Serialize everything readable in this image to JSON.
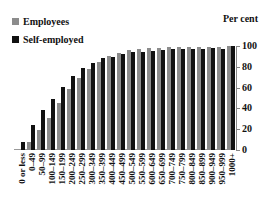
{
  "legend": {
    "items": [
      {
        "label": "Employees",
        "color": "#8c8c8c"
      },
      {
        "label": "Self-employed",
        "color": "#111111"
      }
    ]
  },
  "unit_label": "Per cent",
  "chart_data": {
    "type": "bar",
    "title": "",
    "xlabel": "",
    "ylabel": "Per cent",
    "ylim": [
      0,
      100
    ],
    "yticks": [
      0,
      20,
      40,
      60,
      80,
      100
    ],
    "grid": false,
    "legend_position": "top-left",
    "categories": [
      "0 or less",
      "0–49",
      "50–99",
      "100–149",
      "150–199",
      "200–249",
      "250–299",
      "300–349",
      "350–399",
      "400–449",
      "450–499",
      "500–549",
      "550–599",
      "600–649",
      "650–699",
      "700–749",
      "750–799",
      "800–849",
      "850–899",
      "900–949",
      "950–999",
      "1000+"
    ],
    "series": [
      {
        "name": "Employees",
        "color": "#8c8c8c",
        "values": [
          0,
          8,
          19,
          31,
          45,
          59,
          69,
          78,
          85,
          90,
          93,
          96,
          97,
          98,
          98,
          99,
          99,
          99,
          99,
          99,
          99,
          100
        ]
      },
      {
        "name": "Self-employed",
        "color": "#111111",
        "values": [
          8,
          24,
          38,
          49,
          61,
          71,
          79,
          84,
          88,
          89,
          92,
          94,
          94,
          95,
          96,
          97,
          97,
          97,
          97,
          98,
          97,
          100
        ]
      }
    ]
  }
}
